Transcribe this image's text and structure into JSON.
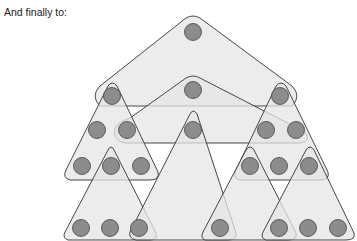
{
  "caption": "And finally to:",
  "colors": {
    "region_fill": "#e6e6e6",
    "stroke": "#333333",
    "node_fill": "#8c8c8c",
    "node_stroke": "#444444"
  },
  "nodes": [
    {
      "x": 193,
      "y": 32
    },
    {
      "x": 112,
      "y": 96
    },
    {
      "x": 193,
      "y": 90
    },
    {
      "x": 280,
      "y": 96
    },
    {
      "x": 97,
      "y": 130
    },
    {
      "x": 127,
      "y": 130
    },
    {
      "x": 193,
      "y": 130
    },
    {
      "x": 266,
      "y": 130
    },
    {
      "x": 296,
      "y": 130
    },
    {
      "x": 82,
      "y": 166
    },
    {
      "x": 111,
      "y": 166
    },
    {
      "x": 141,
      "y": 166
    },
    {
      "x": 250,
      "y": 166
    },
    {
      "x": 279,
      "y": 166
    },
    {
      "x": 309,
      "y": 166
    },
    {
      "x": 81,
      "y": 228
    },
    {
      "x": 110,
      "y": 228
    },
    {
      "x": 139,
      "y": 228
    },
    {
      "x": 220,
      "y": 228
    },
    {
      "x": 279,
      "y": 228
    },
    {
      "x": 308,
      "y": 228
    },
    {
      "x": 338,
      "y": 228
    }
  ]
}
